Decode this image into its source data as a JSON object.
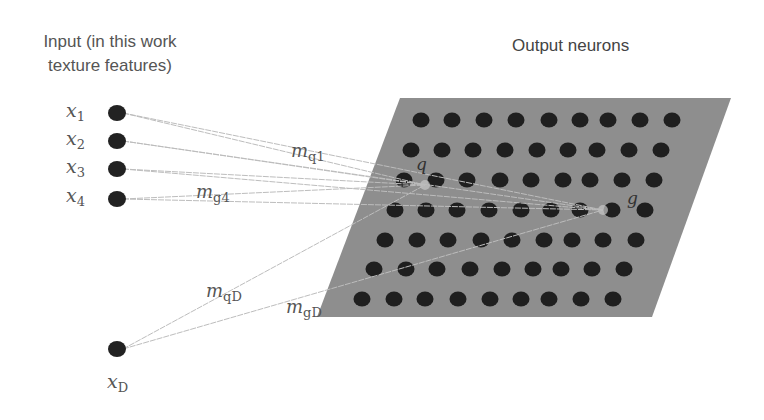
{
  "diagram": {
    "type": "self-organizing-map",
    "input_title_line1": "Input (in this work",
    "input_title_line2": "texture features)",
    "output_title": "Output neurons",
    "colors": {
      "grid_plane": "#8e8e8e",
      "neuron": "#1f1f1f",
      "input_node": "#222222",
      "connection": "#bdbdbd",
      "text": "#555555"
    },
    "inputs": [
      {
        "id": "x1",
        "symbol": "x",
        "subscript": "1",
        "x": 117,
        "y": 113
      },
      {
        "id": "x2",
        "symbol": "x",
        "subscript": "2",
        "x": 117,
        "y": 141
      },
      {
        "id": "x3",
        "symbol": "x",
        "subscript": "3",
        "x": 117,
        "y": 169
      },
      {
        "id": "x4",
        "symbol": "x",
        "subscript": "4",
        "x": 117,
        "y": 199
      },
      {
        "id": "xD",
        "symbol": "x",
        "subscript": "D",
        "x": 117,
        "y": 349
      }
    ],
    "special_neurons": [
      {
        "id": "q",
        "label": "q",
        "x": 425,
        "y": 185
      },
      {
        "id": "g",
        "label": "g",
        "x": 603,
        "y": 210
      }
    ],
    "weight_labels": [
      {
        "id": "mq1",
        "symbol": "m",
        "subscript": "q1"
      },
      {
        "id": "mg4",
        "symbol": "m",
        "subscript": "g4"
      },
      {
        "id": "mqD",
        "symbol": "m",
        "subscript": "qD"
      },
      {
        "id": "mgD",
        "symbol": "m",
        "subscript": "gD"
      }
    ],
    "grid": {
      "rows": 7,
      "cols": 9,
      "plane_corners": [
        [
          400,
          98
        ],
        [
          731,
          98
        ],
        [
          652,
          317
        ],
        [
          317,
          317
        ]
      ],
      "neuron_rows": [
        {
          "y": 120,
          "xs": [
            421,
            452,
            484,
            516,
            549,
            580,
            608,
            640,
            672
          ]
        },
        {
          "y": 150,
          "xs": [
            411,
            442,
            473,
            505,
            537,
            568,
            597,
            629,
            661
          ]
        },
        {
          "y": 180,
          "xs": [
            404,
            436,
            467,
            500,
            531,
            563,
            590,
            622,
            654
          ]
        },
        {
          "y": 210,
          "xs": [
            395,
            426,
            457,
            489,
            521,
            551,
            580,
            612,
            645
          ]
        },
        {
          "y": 240,
          "xs": [
            385,
            417,
            448,
            481,
            512,
            544,
            572,
            603,
            636
          ]
        },
        {
          "y": 269,
          "xs": [
            374,
            406,
            437,
            470,
            502,
            533,
            561,
            592,
            624
          ]
        },
        {
          "y": 299,
          "xs": [
            362,
            394,
            425,
            458,
            490,
            521,
            549,
            581,
            613
          ]
        }
      ]
    }
  }
}
